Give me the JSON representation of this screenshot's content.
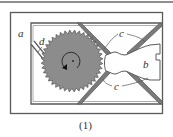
{
  "figure": {
    "caption": "(1)",
    "labels": {
      "a": "a",
      "b": "b",
      "c_top": "c",
      "c_bottom": "c",
      "d": "d"
    },
    "colors": {
      "line": "#5a5a5a",
      "gear_fill": "#8c8c8c",
      "frame_fill": "#ffffff",
      "text": "#333333"
    },
    "gear": {
      "teeth": 40,
      "rotation": "counterclockwise-arrow"
    }
  }
}
